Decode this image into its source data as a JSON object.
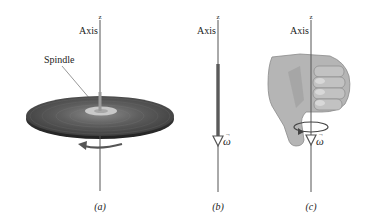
{
  "figure": {
    "panels": [
      {
        "id": "a",
        "caption": "(a)",
        "axis_label": "Axis",
        "axis_name": "z",
        "callout": "Spindle",
        "object": "rotating disc (record) on spindle",
        "rotation": "counterclockwise arrow beneath disc"
      },
      {
        "id": "b",
        "caption": "(b)",
        "axis_label": "Axis",
        "axis_name": "z",
        "vector_label": "ω",
        "vector_arrow": "→",
        "vector_direction": "down"
      },
      {
        "id": "c",
        "caption": "(c)",
        "axis_label": "Axis",
        "axis_name": "z",
        "vector_label": "ω",
        "vector_arrow": "→",
        "object": "right hand, thumb pointing down along axis"
      }
    ],
    "colors": {
      "axis_line": "#555555",
      "disc_dark": "#3a3a3a",
      "disc_mid": "#6a6a6a",
      "label_area": "#c9c9c9",
      "vector": "#5a5a5a",
      "hand_fill": "#b5b5b5",
      "hand_shadow": "#8e8e8e"
    }
  }
}
